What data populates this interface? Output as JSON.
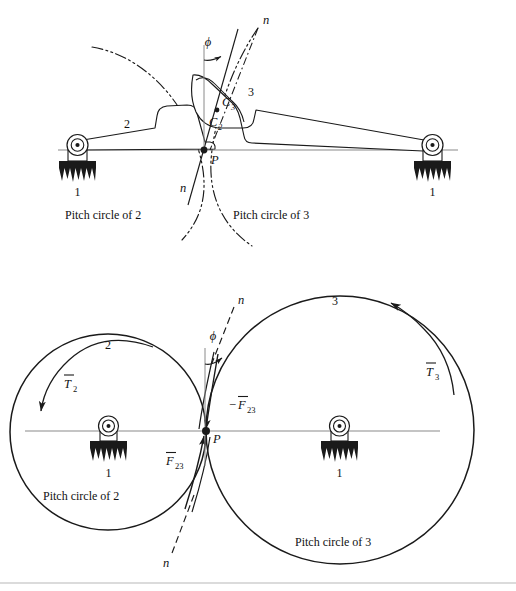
{
  "figure": {
    "stroke_color": "#1a1a1a",
    "axis_color": "#888888"
  },
  "top_diagram": {
    "name": "direct-contact-mechanism",
    "labels": {
      "link1_left": "1",
      "link1_right": "1",
      "link2": "2",
      "link3": "3",
      "contact_point": "P",
      "contact_c2": "C",
      "contact_c2_sub": "2",
      "contact_c3": "C",
      "contact_c3_sub": "3",
      "normal_top": "n",
      "normal_bottom": "n",
      "pressure_angle": "ϕ",
      "pitch_circle_2": "Pitch circle of 2",
      "pitch_circle_3": "Pitch circle of 3"
    }
  },
  "bottom_diagram": {
    "name": "pitch-circles-force-diagram",
    "labels": {
      "link1_left": "1",
      "link1_right": "1",
      "gear2": "2",
      "gear3": "3",
      "contact_point": "P",
      "normal_top": "n",
      "normal_bottom": "n",
      "pressure_angle": "ϕ",
      "torque2": "T",
      "torque2_sub": "2",
      "torque3": "T",
      "torque3_sub": "3",
      "force_23": "F",
      "force_23_sub": "23",
      "force_neg_23_prefix": "−",
      "force_neg_23": "F",
      "force_neg_23_sub": "23",
      "pitch_circle_2": "Pitch circle of 2",
      "pitch_circle_3": "Pitch circle of 3"
    }
  }
}
